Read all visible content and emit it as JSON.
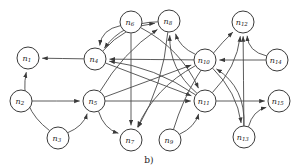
{
  "figure": {
    "caption": "b)",
    "width": 298,
    "height": 168,
    "background": "#ffffff",
    "stroke_color": "#4a4a4a",
    "node_fill": "#ffffff",
    "node_stroke": "#3a3a3a",
    "label_color": "#1a1a1a",
    "node_radius": 11
  },
  "chart_data": {
    "type": "diagram",
    "subtype": "directed-graph",
    "title": "b)",
    "node_count": 15,
    "edge_count": 30,
    "nodes": [
      {
        "id": "n1",
        "base": "n",
        "sub": "1",
        "x": 28,
        "y": 58
      },
      {
        "id": "n2",
        "base": "n",
        "sub": "2",
        "x": 21,
        "y": 101
      },
      {
        "id": "n3",
        "base": "n",
        "sub": "3",
        "x": 58,
        "y": 138
      },
      {
        "id": "n4",
        "base": "n",
        "sub": "4",
        "x": 95,
        "y": 59
      },
      {
        "id": "n5",
        "base": "n",
        "sub": "5",
        "x": 94,
        "y": 101
      },
      {
        "id": "n6",
        "base": "n",
        "sub": "6",
        "x": 131,
        "y": 22
      },
      {
        "id": "n7",
        "base": "n",
        "sub": "7",
        "x": 131,
        "y": 140
      },
      {
        "id": "n8",
        "base": "n",
        "sub": "8",
        "x": 169,
        "y": 21
      },
      {
        "id": "n9",
        "base": "n",
        "sub": "9",
        "x": 170,
        "y": 140
      },
      {
        "id": "n10",
        "base": "n",
        "sub": "10",
        "x": 205,
        "y": 60
      },
      {
        "id": "n11",
        "base": "n",
        "sub": "11",
        "x": 205,
        "y": 101
      },
      {
        "id": "n12",
        "base": "n",
        "sub": "12",
        "x": 243,
        "y": 22
      },
      {
        "id": "n13",
        "base": "n",
        "sub": "13",
        "x": 244,
        "y": 137
      },
      {
        "id": "n14",
        "base": "n",
        "sub": "14",
        "x": 277,
        "y": 60
      },
      {
        "id": "n15",
        "base": "n",
        "sub": "15",
        "x": 279,
        "y": 101
      }
    ],
    "edges": [
      {
        "from": "n4",
        "to": "n1",
        "curve": 0
      },
      {
        "from": "n3",
        "to": "n1",
        "curve": -26
      },
      {
        "from": "n2",
        "to": "n5",
        "curve": 0
      },
      {
        "from": "n3",
        "to": "n5",
        "curve": 10
      },
      {
        "from": "n6",
        "to": "n4",
        "curve": 16
      },
      {
        "from": "n8",
        "to": "n4",
        "curve": 20
      },
      {
        "from": "n10",
        "to": "n4",
        "curve": 0
      },
      {
        "from": "n11",
        "to": "n4",
        "curve": 14
      },
      {
        "from": "n6",
        "to": "n7",
        "curve": 0
      },
      {
        "from": "n8",
        "to": "n7",
        "curve": -14
      },
      {
        "from": "n5",
        "to": "n7",
        "curve": 12
      },
      {
        "from": "n10",
        "to": "n7",
        "curve": 18
      },
      {
        "from": "n5",
        "to": "n8",
        "curve": -12
      },
      {
        "from": "n4",
        "to": "n8",
        "curve": -16
      },
      {
        "from": "n11",
        "to": "n8",
        "curve": -20
      },
      {
        "from": "n10",
        "to": "n8",
        "curve": -10
      },
      {
        "from": "n5",
        "to": "n10",
        "curve": 0
      },
      {
        "from": "n4",
        "to": "n11",
        "curve": 0
      },
      {
        "from": "n5",
        "to": "n11",
        "curve": 0
      },
      {
        "from": "n9",
        "to": "n11",
        "curve": 10
      },
      {
        "from": "n6",
        "to": "n11",
        "curve": -18
      },
      {
        "from": "n14",
        "to": "n10",
        "curve": 0
      },
      {
        "from": "n13",
        "to": "n10",
        "curve": 24
      },
      {
        "from": "n9",
        "to": "n12",
        "curve": -18
      },
      {
        "from": "n11",
        "to": "n12",
        "curve": 14
      },
      {
        "from": "n13",
        "to": "n12",
        "curve": 0
      },
      {
        "from": "n14",
        "to": "n12",
        "curve": -16
      },
      {
        "from": "n11",
        "to": "n15",
        "curve": 0
      },
      {
        "from": "n13",
        "to": "n15",
        "curve": -12
      },
      {
        "from": "n10",
        "to": "n13",
        "curve": -14
      }
    ]
  }
}
